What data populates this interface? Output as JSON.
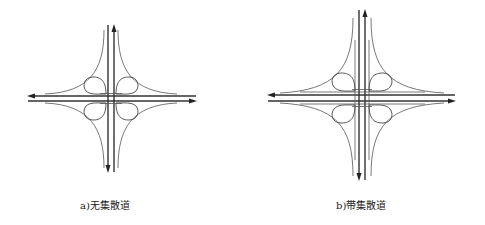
{
  "figure": {
    "panels": [
      {
        "id": "a",
        "caption": "a)无集散道",
        "type": "cloverleaf interchange",
        "collector_distributor": false,
        "center": [
          111,
          98
        ]
      },
      {
        "id": "b",
        "caption": "b)带集散道",
        "type": "cloverleaf interchange",
        "collector_distributor": true,
        "center": [
          362,
          98
        ]
      }
    ],
    "colors": {
      "line": "#333333",
      "background": "#ffffff"
    }
  }
}
